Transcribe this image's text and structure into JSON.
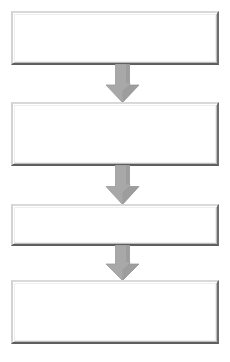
{
  "diagram": {
    "type": "vertical-flowchart",
    "title": "",
    "canvas": {
      "width": 230,
      "height": 362,
      "background": "#ffffff"
    },
    "style": {
      "box_fill": "#ffffff",
      "box_border_light": "#d9d9d9",
      "box_border_dark": "#5e5e5e",
      "arrow_fill": "#a8a8a8",
      "arrow_shade": "#8e8e8e",
      "arrow_outline": "#9a9a9a"
    },
    "nodes": [
      {
        "id": "step-1",
        "label": "",
        "x": 11,
        "y": 11,
        "width": 208,
        "height": 54
      },
      {
        "id": "step-2",
        "label": "",
        "x": 11,
        "y": 102,
        "width": 208,
        "height": 64
      },
      {
        "id": "step-3",
        "label": "",
        "x": 11,
        "y": 204,
        "width": 208,
        "height": 42
      },
      {
        "id": "step-4",
        "label": "",
        "x": 11,
        "y": 280,
        "width": 208,
        "height": 64
      }
    ],
    "connectors": [
      {
        "id": "arrow-1",
        "from": "step-1",
        "to": "step-2",
        "direction": "down",
        "x": 105,
        "y": 64,
        "width": 35,
        "height": 39
      },
      {
        "id": "arrow-2",
        "from": "step-2",
        "to": "step-3",
        "direction": "down",
        "x": 105,
        "y": 165,
        "width": 35,
        "height": 40
      },
      {
        "id": "arrow-3",
        "from": "step-3",
        "to": "step-4",
        "direction": "down",
        "x": 105,
        "y": 245,
        "width": 35,
        "height": 36
      }
    ]
  }
}
